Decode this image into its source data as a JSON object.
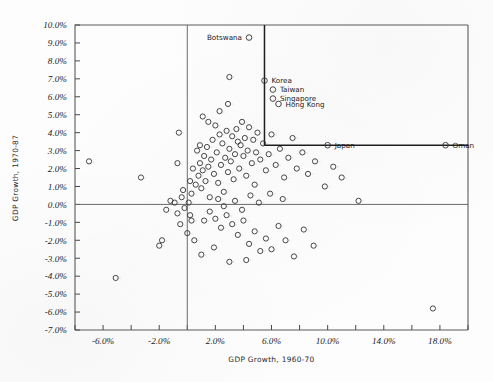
{
  "chart_data": {
    "type": "scatter",
    "title": "",
    "xlabel": "GDP Growth, 1960-70",
    "ylabel": "GDP Growth, 1970-87",
    "xlim": [
      -8.0,
      20.0
    ],
    "ylim": [
      -7.0,
      10.0
    ],
    "xtick_step": 2.0,
    "ytick_step": 1.0,
    "xticklabels": [
      "-6.0%",
      "-2.0%",
      "2.0%",
      "6.0%",
      "10.0%",
      "14.0%",
      "18.0%"
    ],
    "xticklabel_values": [
      -6.0,
      -2.0,
      2.0,
      6.0,
      10.0,
      14.0,
      18.0
    ],
    "yticklabels": [
      "10.0%",
      "9.0%",
      "8.0%",
      "7.0%",
      "6.0%",
      "5.0%",
      "4.0%",
      "3.0%",
      "2.0%",
      "1.0%",
      "0.0%",
      "-1.0%",
      "-2.0%",
      "-3.0%",
      "-4.0%",
      "-5.0%",
      "-6.0%",
      "-7.0%"
    ],
    "yticklabel_values": [
      10.0,
      9.0,
      8.0,
      7.0,
      6.0,
      5.0,
      4.0,
      3.0,
      2.0,
      1.0,
      0.0,
      -1.0,
      -2.0,
      -3.0,
      -4.0,
      -5.0,
      -6.0,
      -7.0
    ],
    "grid": false,
    "legend": "none",
    "marker": "open-circle",
    "zero_lines": {
      "x": 0.0,
      "y": 0.0
    },
    "annotation_bracket": {
      "description": "L-shaped reference bracket enclosing high-growth East Asian economies",
      "vertical_x": 5.5,
      "vertical_y_top": 10.0,
      "vertical_y_bottom": 3.3,
      "horizontal_y": 3.3,
      "horizontal_x_end": 20.0
    },
    "labeled_points": [
      {
        "label": "Botswana",
        "x": 4.4,
        "y": 9.3,
        "label_side": "left"
      },
      {
        "label": "Korea",
        "x": 5.5,
        "y": 6.9,
        "label_side": "right"
      },
      {
        "label": "Taiwan",
        "x": 6.1,
        "y": 6.4,
        "label_side": "right"
      },
      {
        "label": "Singapore",
        "x": 6.1,
        "y": 5.9,
        "label_side": "right"
      },
      {
        "label": "Hong Kong",
        "x": 6.5,
        "y": 5.6,
        "label_side": "right"
      },
      {
        "label": "Japan",
        "x": 10.0,
        "y": 3.3,
        "label_side": "right"
      },
      {
        "label": "Oman",
        "x": 18.4,
        "y": 3.3,
        "label_side": "right"
      }
    ],
    "unlabeled_points": [
      {
        "x": -5.1,
        "y": -4.1
      },
      {
        "x": -7.0,
        "y": 2.4
      },
      {
        "x": -3.3,
        "y": 1.5
      },
      {
        "x": -1.5,
        "y": -0.3
      },
      {
        "x": -1.2,
        "y": 0.2
      },
      {
        "x": -0.9,
        "y": 0.1
      },
      {
        "x": -0.7,
        "y": -0.5
      },
      {
        "x": -0.4,
        "y": 0.4
      },
      {
        "x": -0.2,
        "y": -0.2
      },
      {
        "x": -0.3,
        "y": 0.8
      },
      {
        "x": 0.1,
        "y": 0.1
      },
      {
        "x": 0.2,
        "y": -0.6
      },
      {
        "x": 0.3,
        "y": 0.6
      },
      {
        "x": -2.0,
        "y": -2.3
      },
      {
        "x": -1.8,
        "y": -2.0
      },
      {
        "x": -0.6,
        "y": 4.0
      },
      {
        "x": -0.7,
        "y": 2.3
      },
      {
        "x": 0.6,
        "y": 1.1
      },
      {
        "x": 0.8,
        "y": 1.6
      },
      {
        "x": 0.9,
        "y": 2.3
      },
      {
        "x": 1.0,
        "y": 0.9
      },
      {
        "x": 1.1,
        "y": 1.9
      },
      {
        "x": 1.2,
        "y": 2.7
      },
      {
        "x": 1.3,
        "y": 1.3
      },
      {
        "x": 1.4,
        "y": 3.2
      },
      {
        "x": 1.5,
        "y": 2.1
      },
      {
        "x": 1.6,
        "y": 0.4
      },
      {
        "x": 1.7,
        "y": 2.5
      },
      {
        "x": 1.8,
        "y": 3.6
      },
      {
        "x": 1.9,
        "y": 1.7
      },
      {
        "x": 2.0,
        "y": 4.4
      },
      {
        "x": 2.1,
        "y": 2.9
      },
      {
        "x": 2.2,
        "y": 1.2
      },
      {
        "x": 2.3,
        "y": 3.9
      },
      {
        "x": 2.4,
        "y": 2.2
      },
      {
        "x": 2.5,
        "y": 3.4
      },
      {
        "x": 2.6,
        "y": 0.7
      },
      {
        "x": 2.7,
        "y": 2.6
      },
      {
        "x": 2.8,
        "y": 4.1
      },
      {
        "x": 2.9,
        "y": 1.8
      },
      {
        "x": 3.0,
        "y": 3.1
      },
      {
        "x": 3.1,
        "y": 2.4
      },
      {
        "x": 3.2,
        "y": 3.8
      },
      {
        "x": 3.3,
        "y": 1.4
      },
      {
        "x": 3.4,
        "y": 2.8
      },
      {
        "x": 3.5,
        "y": 4.2
      },
      {
        "x": 3.6,
        "y": 3.5
      },
      {
        "x": 3.7,
        "y": 2.0
      },
      {
        "x": 3.8,
        "y": 3.3
      },
      {
        "x": 3.9,
        "y": 4.6
      },
      {
        "x": 4.0,
        "y": 2.7
      },
      {
        "x": 4.1,
        "y": 3.7
      },
      {
        "x": 4.2,
        "y": 1.6
      },
      {
        "x": 4.3,
        "y": 3.0
      },
      {
        "x": 4.4,
        "y": 4.3
      },
      {
        "x": 4.6,
        "y": 2.3
      },
      {
        "x": 4.7,
        "y": 3.6
      },
      {
        "x": 4.8,
        "y": 1.1
      },
      {
        "x": 4.9,
        "y": 2.9
      },
      {
        "x": 5.0,
        "y": 4.0
      },
      {
        "x": 5.2,
        "y": 2.5
      },
      {
        "x": 5.4,
        "y": 3.4
      },
      {
        "x": 5.6,
        "y": 1.9
      },
      {
        "x": 5.8,
        "y": 2.8
      },
      {
        "x": 6.0,
        "y": 3.9
      },
      {
        "x": 6.3,
        "y": 2.2
      },
      {
        "x": 6.6,
        "y": 3.1
      },
      {
        "x": 6.9,
        "y": 1.5
      },
      {
        "x": 7.2,
        "y": 2.6
      },
      {
        "x": 7.5,
        "y": 3.7
      },
      {
        "x": 7.8,
        "y": 2.0
      },
      {
        "x": 8.2,
        "y": 2.9
      },
      {
        "x": 8.6,
        "y": 1.7
      },
      {
        "x": 9.1,
        "y": 2.4
      },
      {
        "x": 3.0,
        "y": 7.1
      },
      {
        "x": 2.3,
        "y": 5.2
      },
      {
        "x": 1.5,
        "y": 4.6
      },
      {
        "x": 0.9,
        "y": 3.3
      },
      {
        "x": 1.2,
        "y": -0.9
      },
      {
        "x": 1.6,
        "y": -0.4
      },
      {
        "x": 2.0,
        "y": -0.8
      },
      {
        "x": 2.4,
        "y": -1.3
      },
      {
        "x": 2.8,
        "y": -0.6
      },
      {
        "x": 3.2,
        "y": -1.1
      },
      {
        "x": 3.6,
        "y": -1.7
      },
      {
        "x": 4.0,
        "y": -0.9
      },
      {
        "x": 4.4,
        "y": -2.2
      },
      {
        "x": 4.8,
        "y": -1.5
      },
      {
        "x": 5.2,
        "y": -2.6
      },
      {
        "x": 5.6,
        "y": -1.9
      },
      {
        "x": 6.0,
        "y": -2.5
      },
      {
        "x": 6.5,
        "y": -1.2
      },
      {
        "x": 7.0,
        "y": -2.0
      },
      {
        "x": 7.6,
        "y": -2.9
      },
      {
        "x": 8.3,
        "y": -1.4
      },
      {
        "x": 9.0,
        "y": -2.3
      },
      {
        "x": 3.0,
        "y": -3.2
      },
      {
        "x": 4.2,
        "y": -3.1
      },
      {
        "x": 17.5,
        "y": -5.8
      },
      {
        "x": 2.2,
        "y": 0.3
      },
      {
        "x": 2.6,
        "y": -0.1
      },
      {
        "x": 3.4,
        "y": 0.2
      },
      {
        "x": 3.9,
        "y": -0.3
      },
      {
        "x": 4.5,
        "y": 0.5
      },
      {
        "x": 5.1,
        "y": 0.1
      },
      {
        "x": 5.9,
        "y": 0.6
      },
      {
        "x": 6.8,
        "y": 0.3
      },
      {
        "x": 0.4,
        "y": 2.0
      },
      {
        "x": 0.2,
        "y": 1.3
      },
      {
        "x": 0.7,
        "y": 3.0
      },
      {
        "x": 1.1,
        "y": 4.9
      },
      {
        "x": 2.9,
        "y": 5.6
      },
      {
        "x": 9.8,
        "y": 1.0
      },
      {
        "x": 10.4,
        "y": 2.1
      },
      {
        "x": 11.0,
        "y": 1.5
      },
      {
        "x": 12.2,
        "y": 0.2
      },
      {
        "x": 0.0,
        "y": -1.6
      },
      {
        "x": -0.5,
        "y": -1.1
      },
      {
        "x": 0.5,
        "y": -2.0
      },
      {
        "x": 1.0,
        "y": -2.8
      },
      {
        "x": 0.3,
        "y": -0.9
      },
      {
        "x": 1.9,
        "y": -2.4
      }
    ]
  }
}
